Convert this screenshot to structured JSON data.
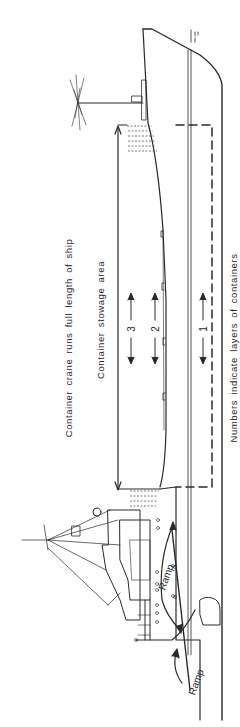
{
  "diagram": {
    "orientation": "bow at top, stern at bottom, rotated 90 degrees",
    "labels": {
      "crane": "Container crane runs full length of ship",
      "stowage": "Container stowage area",
      "layers_note": "Numbers indicate layers of containers",
      "ramp_internal": "Ramp",
      "ramp_stern": "Ramp"
    },
    "layers": [
      {
        "number": "3",
        "label": "3"
      },
      {
        "number": "2",
        "label": "2"
      },
      {
        "number": "1",
        "label": "1"
      }
    ],
    "colors": {
      "line": "#2a2a2a",
      "background": "#ffffff",
      "hatch": "#555555"
    }
  }
}
